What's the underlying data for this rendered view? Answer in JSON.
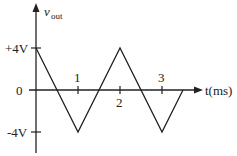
{
  "diagram": {
    "y_axis_label": "v",
    "y_axis_subscript": "out",
    "x_axis_label": "t(ms)",
    "y_ticks": [
      {
        "label": "+4V",
        "value": 4
      },
      {
        "label": "0",
        "value": 0
      },
      {
        "label": "-4V",
        "value": -4
      }
    ],
    "x_ticks": [
      {
        "label": "1",
        "value": 1
      },
      {
        "label": "2",
        "value": 2
      },
      {
        "label": "3",
        "value": 3
      }
    ],
    "waveform": {
      "type": "triangle",
      "points": [
        [
          0,
          4
        ],
        [
          1,
          -4
        ],
        [
          2,
          4
        ],
        [
          3,
          -4
        ],
        [
          3.5,
          0
        ]
      ]
    },
    "line_color": "#222222"
  }
}
